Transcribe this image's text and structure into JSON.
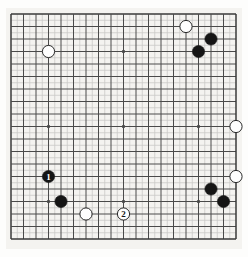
{
  "figure": {
    "kind": "go-board-diagram",
    "board_size": 19,
    "background_color": "#f4f3f0",
    "line_color": "#4a4a4a",
    "fine_line_color": "#c9c9c6",
    "border_color": "#3a3a3a",
    "black_color": "#151515",
    "white_color": "#fefefe",
    "white_outline_color": "#2a2a2a"
  },
  "geometry": {
    "origin_x": 11,
    "origin_y": 14,
    "cell": 12.5,
    "stone_radius": 6.1,
    "star_radius": 1.7,
    "star_points": [
      {
        "col": 4,
        "row": 4
      },
      {
        "col": 10,
        "row": 4
      },
      {
        "col": 16,
        "row": 4
      },
      {
        "col": 4,
        "row": 10
      },
      {
        "col": 10,
        "row": 10
      },
      {
        "col": 16,
        "row": 10
      },
      {
        "col": 4,
        "row": 16
      },
      {
        "col": 10,
        "row": 16
      },
      {
        "col": 16,
        "row": 16
      }
    ]
  },
  "stones": [
    {
      "id": "w-top-left-star",
      "color": "white",
      "col": 4,
      "row": 4,
      "label": ""
    },
    {
      "id": "w-top-right",
      "color": "white",
      "col": 15,
      "row": 2,
      "label": ""
    },
    {
      "id": "b-top-right-outer",
      "color": "black",
      "col": 17,
      "row": 3,
      "label": ""
    },
    {
      "id": "b-top-right-inner",
      "color": "black",
      "col": 16,
      "row": 4,
      "label": ""
    },
    {
      "id": "w-right-upper",
      "color": "white",
      "col": 19,
      "row": 10,
      "label": ""
    },
    {
      "id": "b-move-1",
      "color": "black",
      "col": 4,
      "row": 14,
      "label": "1"
    },
    {
      "id": "w-right-lower",
      "color": "white",
      "col": 19,
      "row": 14,
      "label": ""
    },
    {
      "id": "b-bottom-right-up",
      "color": "black",
      "col": 17,
      "row": 15,
      "label": ""
    },
    {
      "id": "b-bottom-left",
      "color": "black",
      "col": 5,
      "row": 16,
      "label": ""
    },
    {
      "id": "b-bottom-right-low",
      "color": "black",
      "col": 18,
      "row": 16,
      "label": ""
    },
    {
      "id": "w-bottom-left",
      "color": "white",
      "col": 7,
      "row": 17,
      "label": ""
    },
    {
      "id": "w-move-2",
      "color": "white",
      "col": 10,
      "row": 17,
      "label": "2"
    }
  ],
  "moves": {
    "black_move_label": "1",
    "white_move_label": "2"
  }
}
